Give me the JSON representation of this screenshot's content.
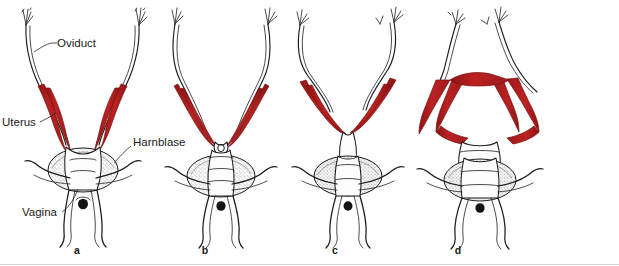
{
  "figure": {
    "background_color": "#ffffff",
    "uterus_color": "#bc2222",
    "uterus_color_dark": "#8e1414",
    "outline_color": "#1d1d1d",
    "label_color": "#1a1a1a"
  },
  "labels": {
    "oviduct": "Oviduct",
    "uterus": "Uterus",
    "harnblase": "Harnblase",
    "vagina": "Vagina"
  },
  "panels": [
    {
      "letter": "a",
      "x": 77
    },
    {
      "letter": "b",
      "x": 205
    },
    {
      "letter": "c",
      "x": 335
    },
    {
      "letter": "d",
      "x": 458
    }
  ]
}
